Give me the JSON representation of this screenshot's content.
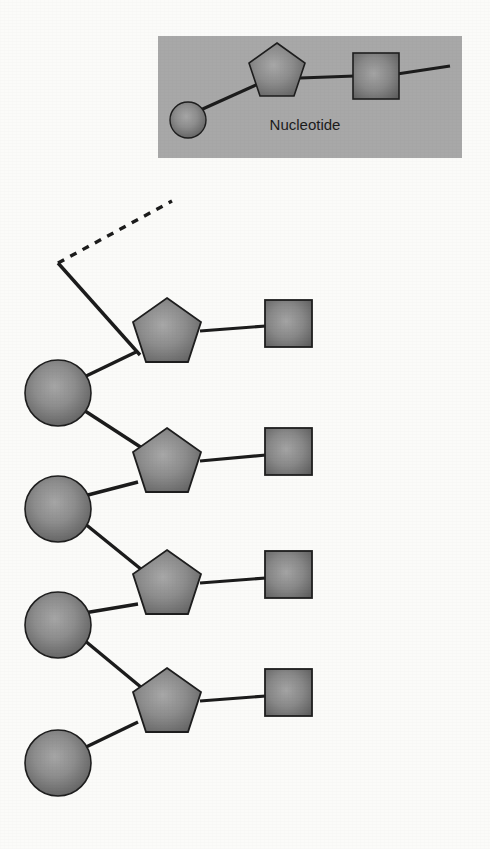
{
  "figure": {
    "background_color": "#fbfbf9",
    "shape_fill_center": "#9d9d9d",
    "shape_fill_edge": "#5f5f5f",
    "shape_stroke": "#1e1e1e",
    "bond_color": "#1c1c1c"
  },
  "legend": {
    "label": "Nucleotide",
    "background_color": "#a8a8a8",
    "box": {
      "x": 158,
      "y": 36,
      "width": 304,
      "height": 122
    },
    "label_pos": {
      "x": 305,
      "y": 130
    },
    "phosphate": {
      "cx": 188,
      "cy": 120,
      "r": 18,
      "name": "phosphate"
    },
    "sugar": {
      "cx": 277,
      "cy": 73,
      "r": 30,
      "name": "sugar"
    },
    "base": {
      "cx": 376,
      "cy": 76,
      "size": 46,
      "name": "base"
    },
    "tail_end_x": 450
  },
  "strand": {
    "dashed_bond": {
      "x1": 58,
      "y1": 263,
      "x2": 172,
      "y2": 201
    },
    "phosphates": [
      {
        "cx": 58,
        "cy": 393,
        "r": 33
      },
      {
        "cx": 58,
        "cy": 509,
        "r": 33
      },
      {
        "cx": 58,
        "cy": 625,
        "r": 33
      },
      {
        "cx": 58,
        "cy": 763,
        "r": 33
      }
    ],
    "sugars": [
      {
        "cx": 167,
        "cy": 333,
        "r": 36
      },
      {
        "cx": 167,
        "cy": 463,
        "r": 36
      },
      {
        "cx": 167,
        "cy": 585,
        "r": 36
      },
      {
        "cx": 167,
        "cy": 703,
        "r": 36
      }
    ],
    "bases": [
      {
        "cx": 288,
        "cy": 323,
        "size": 47
      },
      {
        "cx": 288,
        "cy": 451,
        "size": 47
      },
      {
        "cx": 288,
        "cy": 574,
        "size": 47
      },
      {
        "cx": 288,
        "cy": 692,
        "size": 47
      }
    ],
    "backbone_start": {
      "x": 58,
      "y": 263
    },
    "counts": {
      "phosphates": 4,
      "sugars": 4,
      "bases": 4
    }
  }
}
